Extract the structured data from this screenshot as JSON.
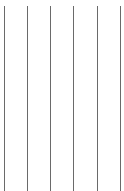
{
  "canvas": {
    "width": 124,
    "height": 191,
    "background": "#ffffff"
  },
  "lines": {
    "color": "#6a6a6a",
    "top": 6,
    "items": [
      {
        "x": 4
      },
      {
        "x": 27
      },
      {
        "x": 50
      },
      {
        "x": 73
      },
      {
        "x": 97
      },
      {
        "x": 120
      }
    ]
  }
}
